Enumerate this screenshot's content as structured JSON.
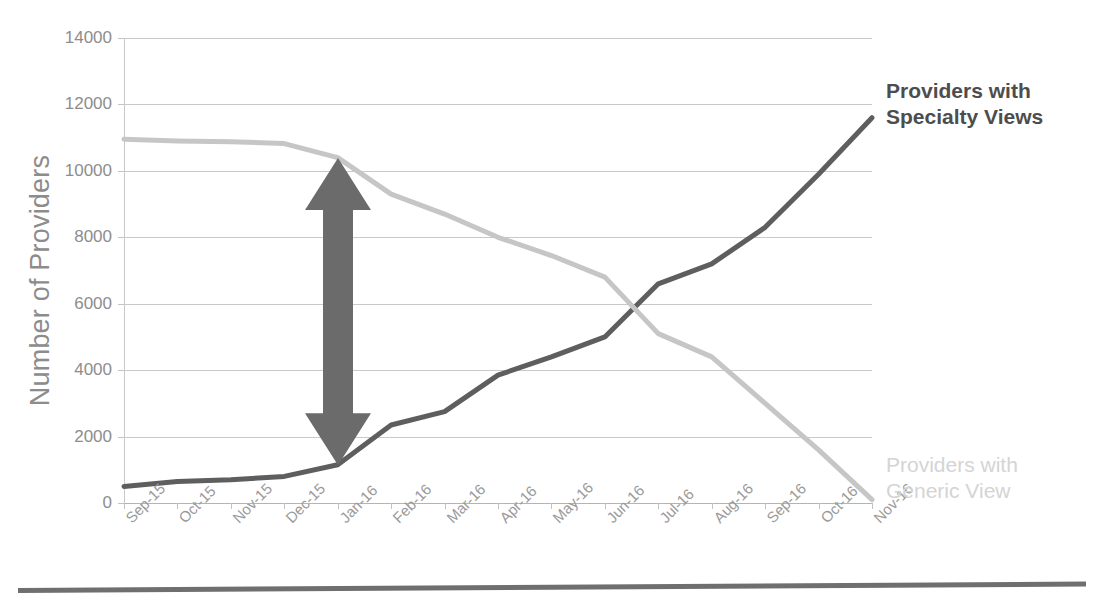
{
  "chart_data": {
    "type": "line",
    "title": "",
    "xlabel": "",
    "ylabel": "Number of Providers",
    "ylim": [
      0,
      14000
    ],
    "ytick_step": 2000,
    "yticks": [
      "0",
      "2000",
      "4000",
      "6000",
      "8000",
      "10000",
      "12000",
      "14000"
    ],
    "grid": true,
    "legend_position": "right-inline",
    "categories": [
      "Sep-15",
      "Oct-15",
      "Nov-15",
      "Dec-15",
      "Jan-16",
      "Feb-16",
      "Mar-16",
      "Apr-16",
      "May-16",
      "Jun-16",
      "Jul-16",
      "Aug-16",
      "Sep-16",
      "Oct-16",
      "Nov-16"
    ],
    "series": [
      {
        "name": "Providers with Specialty Views",
        "color": "#5e5e5e",
        "values": [
          500,
          650,
          700,
          800,
          1150,
          2350,
          2750,
          3850,
          4400,
          5000,
          6600,
          7200,
          8300,
          9900,
          11600
        ]
      },
      {
        "name": "Providers with Generic View",
        "color": "#c6c6c6",
        "values": [
          10950,
          10900,
          10880,
          10820,
          10400,
          9300,
          8700,
          8000,
          7450,
          6800,
          5100,
          4400,
          3000,
          1600,
          100
        ]
      }
    ],
    "annotations": [
      {
        "name": "gap-arrow",
        "type": "double-headed-vertical-arrow",
        "at_category": "Jan-16",
        "from_value": 1150,
        "to_value": 10400,
        "color": "#6b6b6b"
      }
    ]
  },
  "axis": {
    "y_title": "Number of Providers"
  },
  "labels": {
    "specialty_line1": "Providers with",
    "specialty_line2": "Specialty Views",
    "generic_line1": "Providers with",
    "generic_line2": "Generic View"
  },
  "colors": {
    "specialty": "#5e5e5e",
    "generic": "#c6c6c6",
    "arrow": "#6b6b6b",
    "grid": "#c9c9c9",
    "tick_text": "#8d8d8d",
    "axis_title": "#8c8c8c",
    "rule": "#6f6f6f"
  }
}
